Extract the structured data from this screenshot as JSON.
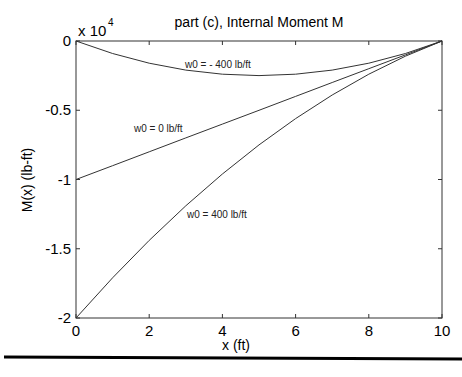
{
  "chart_data": {
    "type": "line",
    "title": "part (c), Internal Moment M",
    "xlabel": "x (ft)",
    "ylabel": "M(x) (lb-ft)",
    "y_multiplier_label": "x 10",
    "y_multiplier_exponent": "4",
    "xlim": [
      0,
      10
    ],
    "ylim": [
      -20000,
      0
    ],
    "xticks": [
      0,
      2,
      4,
      6,
      8,
      10
    ],
    "xtick_labels": [
      "0",
      "2",
      "4",
      "6",
      "8",
      "10"
    ],
    "yticks": [
      0,
      -5000,
      -10000,
      -15000,
      -20000
    ],
    "ytick_labels": [
      "0",
      "-0.5",
      "-1",
      "-1.5",
      "-2"
    ],
    "grid": false,
    "series": [
      {
        "name": "w0 = - 400 lb/ft",
        "x": [
          0,
          1,
          2,
          3,
          4,
          5,
          6,
          7,
          8,
          9,
          10
        ],
        "values": [
          0,
          -900,
          -1600,
          -2100,
          -2400,
          -2500,
          -2400,
          -2100,
          -1600,
          -900,
          0
        ]
      },
      {
        "name": "w0 = 0 lb/ft",
        "x": [
          0,
          1,
          2,
          3,
          4,
          5,
          6,
          7,
          8,
          9,
          10
        ],
        "values": [
          -10000,
          -9000,
          -8000,
          -7000,
          -6000,
          -5000,
          -4000,
          -3000,
          -2000,
          -1000,
          0
        ]
      },
      {
        "name": "w0 = 400 lb/ft",
        "x": [
          0,
          1,
          2,
          3,
          4,
          5,
          6,
          7,
          8,
          9,
          10
        ],
        "values": [
          -20000,
          -17100,
          -14400,
          -11900,
          -9600,
          -7500,
          -5600,
          -3900,
          -2400,
          -1100,
          0
        ]
      }
    ]
  }
}
